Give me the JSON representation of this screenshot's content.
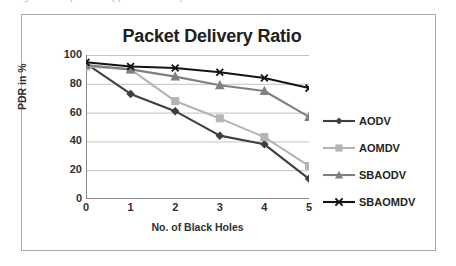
{
  "caption": "Figure: Comparison of packet delivery ratio",
  "chart_data": {
    "type": "line",
    "title": "Packet Delivery Ratio",
    "xlabel": "No. of Black Holes",
    "ylabel": "PDR in %",
    "categories": [
      "0",
      "1",
      "2",
      "3",
      "4",
      "5"
    ],
    "x": [
      0,
      1,
      2,
      3,
      4,
      5
    ],
    "xlim": [
      0,
      5
    ],
    "ylim": [
      0,
      100
    ],
    "yticks": [
      0,
      20,
      40,
      60,
      80,
      100
    ],
    "grid": "horizontal",
    "legend_position": "right",
    "series": [
      {
        "name": "AODV",
        "values": [
          94,
          73,
          61,
          44,
          38,
          14
        ],
        "color": "#3f3f3f",
        "marker": "diamond"
      },
      {
        "name": "AOMDV",
        "values": [
          92,
          90,
          68,
          56,
          43,
          23
        ],
        "color": "#b4b4b4",
        "marker": "square"
      },
      {
        "name": "SBAODV",
        "values": [
          93,
          90,
          85,
          79,
          75,
          57
        ],
        "color": "#808080",
        "marker": "triangle"
      },
      {
        "name": "SBAOMDV",
        "values": [
          95,
          92,
          91,
          88,
          84,
          77
        ],
        "color": "#141414",
        "marker": "x"
      }
    ]
  }
}
